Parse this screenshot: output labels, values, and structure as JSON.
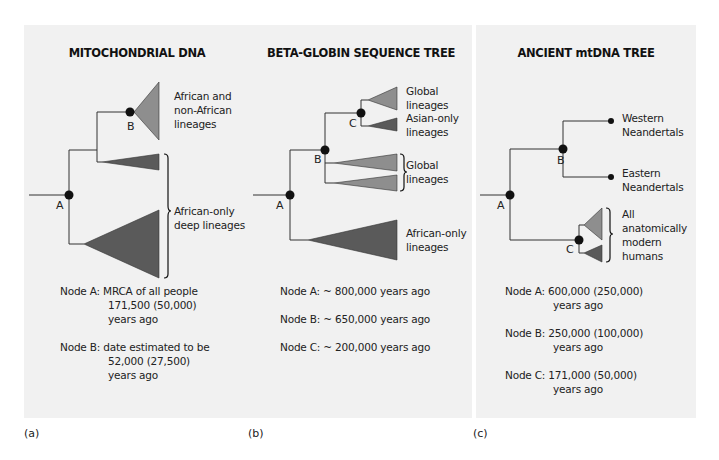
{
  "panels": [
    {
      "letter": "(a)",
      "title": "MITOCHONDRIAL DNA",
      "nodes": [
        "A",
        "B"
      ],
      "clade_labels": [
        "African and",
        "non-African",
        "lineages",
        "African-only",
        "deep lineages"
      ],
      "notes": [
        {
          "key": "Node A:",
          "lines": [
            "MRCA of all people",
            "171,500 (50,000)",
            "years ago"
          ]
        },
        {
          "key": "Node B:",
          "lines": [
            "date estimated to be",
            "52,000 (27,500)",
            "years ago"
          ]
        }
      ]
    },
    {
      "letter": "(b)",
      "title": "BETA-GLOBIN SEQUENCE TREE",
      "nodes": [
        "A",
        "B",
        "C"
      ],
      "clade_labels": [
        "Global",
        "lineages",
        "Asian-only",
        "lineages",
        "Global",
        "lineages",
        "African-only",
        "lineages"
      ],
      "notes": [
        {
          "key": "Node A:",
          "lines": [
            "~ 800,000 years ago"
          ]
        },
        {
          "key": "Node B:",
          "lines": [
            "~ 650,000 years ago"
          ]
        },
        {
          "key": "Node C:",
          "lines": [
            "~ 200,000 years ago"
          ]
        }
      ]
    },
    {
      "letter": "(c)",
      "title": "ANCIENT mtDNA TREE",
      "nodes": [
        "A",
        "B",
        "C"
      ],
      "clade_labels": [
        "Western",
        "Neandertals",
        "Eastern",
        "Neandertals",
        "All",
        "anatomically",
        "modern",
        "humans"
      ],
      "notes": [
        {
          "key": "Node A:",
          "lines": [
            "600,000 (250,000)",
            "years ago"
          ]
        },
        {
          "key": "Node B:",
          "lines": [
            "250,000 (100,000)",
            "years ago"
          ]
        },
        {
          "key": "Node C:",
          "lines": [
            "171,000 (50,000)",
            "years ago"
          ]
        }
      ]
    }
  ],
  "colors": {
    "panel_bg": "#f1f1f1",
    "light_clade": "#8e8e8e",
    "dark_clade": "#5a5a5a",
    "line": "#333333"
  }
}
